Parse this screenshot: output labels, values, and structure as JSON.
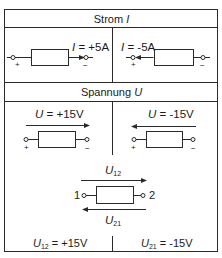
{
  "sections": {
    "strom": {
      "title": "Strom",
      "title_symbol": "I",
      "left": {
        "label_symbol": "I",
        "label_value": " = +5A",
        "plus": "+",
        "minus": "−",
        "arrow_direction": "right"
      },
      "right": {
        "label_symbol": "I",
        "label_value": " = -5A",
        "plus": "+",
        "minus": "−",
        "arrow_direction": "left"
      }
    },
    "spannung": {
      "title": "Spannung",
      "title_symbol": "U",
      "left": {
        "label_symbol": "U",
        "label_value": " = +15V",
        "plus": "+",
        "minus": "−",
        "arrow_direction": "right"
      },
      "right": {
        "label_symbol": "U",
        "label_value": " = -15V",
        "plus": "+",
        "minus": "−",
        "arrow_direction": "left"
      },
      "bottom": {
        "top_label_symbol": "U",
        "top_label_sub": "12",
        "bottom_label_symbol": "U",
        "bottom_label_sub": "21",
        "terminal_left": "1",
        "terminal_right": "2",
        "result_left_symbol": "U",
        "result_left_sub": "12",
        "result_left_value": " = +15V",
        "result_right_symbol": "U",
        "result_right_sub": "21",
        "result_right_value": " = -15V"
      }
    }
  },
  "colors": {
    "line": "#2a2a2a",
    "background": "#ffffff"
  }
}
